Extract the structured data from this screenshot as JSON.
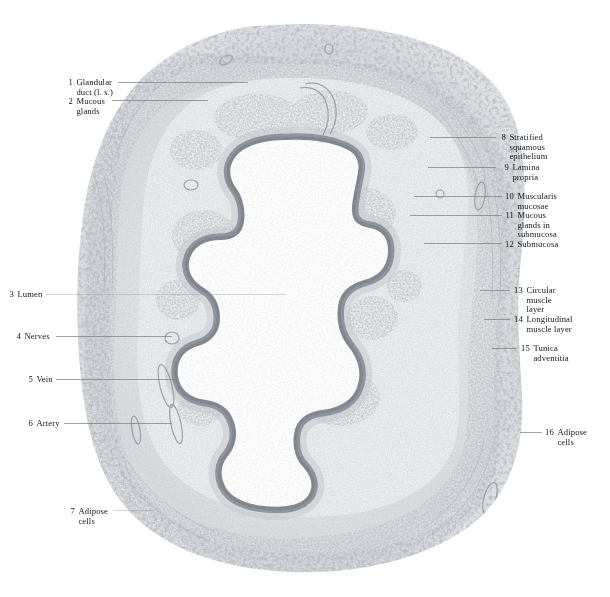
{
  "plate": {
    "kind": "histology-micrograph",
    "subject": "esophagus cross section",
    "background_color": "#ffffff",
    "tissue_tone": "#b9bcc0",
    "epithelium_tone": "#8b8f96",
    "lumen_color": "#ffffff"
  },
  "labels_left": [
    {
      "num": "1",
      "lines": [
        "Glandular",
        "duct (l. s.)"
      ],
      "x": 66,
      "y": 78,
      "leader": {
        "x": 118,
        "y": 82,
        "w": 130
      }
    },
    {
      "num": "2",
      "lines": [
        "Mucous",
        "glands"
      ],
      "x": 66,
      "y": 97,
      "leader": {
        "x": 112,
        "y": 100,
        "w": 96
      }
    },
    {
      "num": "3",
      "lines": [
        "Lumen"
      ],
      "x": 7,
      "y": 290,
      "leader": {
        "x": 46,
        "y": 294,
        "w": 240
      }
    },
    {
      "num": "4",
      "lines": [
        "Nerves"
      ],
      "x": 14,
      "y": 332,
      "leader": {
        "x": 56,
        "y": 336,
        "w": 116
      }
    },
    {
      "num": "5",
      "lines": [
        "Vein"
      ],
      "x": 26,
      "y": 375,
      "leader": {
        "x": 56,
        "y": 379,
        "w": 122
      }
    },
    {
      "num": "6",
      "lines": [
        "Artery"
      ],
      "x": 26,
      "y": 419,
      "leader": {
        "x": 64,
        "y": 423,
        "w": 108
      }
    },
    {
      "num": "7",
      "lines": [
        "Adipose",
        "cells"
      ],
      "x": 68,
      "y": 507,
      "leader": {
        "x": 113,
        "y": 510,
        "w": 42
      }
    }
  ],
  "labels_right": [
    {
      "num": "8",
      "lines": [
        "Stratified",
        "squamous",
        "epithelium"
      ],
      "x": 497,
      "y": 133,
      "leader": {
        "x": 430,
        "y": 137,
        "w": 66
      }
    },
    {
      "num": "9",
      "lines": [
        "Lamina",
        "propria"
      ],
      "x": 500,
      "y": 163,
      "leader": {
        "x": 428,
        "y": 167,
        "w": 68
      }
    },
    {
      "num": "10",
      "lines": [
        "Muscularis",
        "mucosae"
      ],
      "x": 505,
      "y": 192,
      "leader": {
        "x": 414,
        "y": 196,
        "w": 88
      }
    },
    {
      "num": "11",
      "lines": [
        "Mucous",
        "glands in",
        "submucosa"
      ],
      "x": 505,
      "y": 211,
      "leader": {
        "x": 410,
        "y": 215,
        "w": 92
      }
    },
    {
      "num": "12",
      "lines": [
        "Submucosa"
      ],
      "x": 505,
      "y": 240,
      "leader": {
        "x": 424,
        "y": 243,
        "w": 78
      }
    },
    {
      "num": "13",
      "lines": [
        "Circular",
        "muscle",
        "layer"
      ],
      "x": 514,
      "y": 286,
      "leader": {
        "x": 480,
        "y": 290,
        "w": 30
      }
    },
    {
      "num": "14",
      "lines": [
        "Longitudinal",
        "muscle layer"
      ],
      "x": 514,
      "y": 315,
      "leader": {
        "x": 484,
        "y": 319,
        "w": 26
      }
    },
    {
      "num": "15",
      "lines": [
        "Tunica",
        "adventitia"
      ],
      "x": 521,
      "y": 344,
      "leader": {
        "x": 492,
        "y": 348,
        "w": 24
      }
    },
    {
      "num": "16",
      "lines": [
        "Adipose",
        "cells"
      ],
      "x": 545,
      "y": 428,
      "leader": {
        "x": 520,
        "y": 432,
        "w": 22
      }
    }
  ]
}
